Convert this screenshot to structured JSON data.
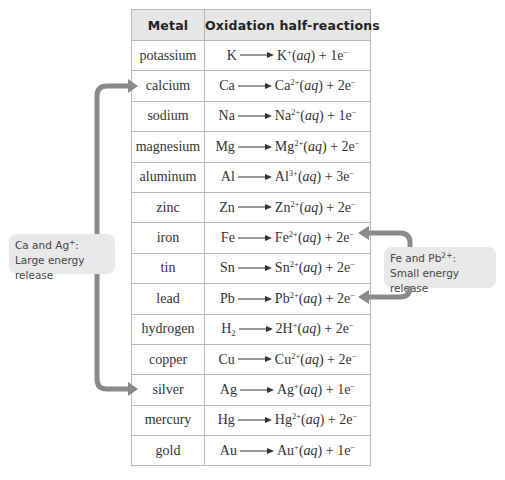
{
  "table": {
    "headers": [
      "Metal",
      "Oxidation half-reactions"
    ],
    "rows": [
      {
        "metal": "potassium",
        "reactant": "K",
        "reactant_sub": "",
        "coef": "",
        "ion": "K",
        "charge": "+",
        "state": "aq",
        "electrons": "1e",
        "e_charge": "−"
      },
      {
        "metal": "calcium",
        "reactant": "Ca",
        "reactant_sub": "",
        "coef": "",
        "ion": "Ca",
        "charge": "2+",
        "state": "aq",
        "electrons": "2e",
        "e_charge": "−"
      },
      {
        "metal": "sodium",
        "reactant": "Na",
        "reactant_sub": "",
        "coef": "",
        "ion": "Na",
        "charge": "2+",
        "state": "aq",
        "electrons": "1e",
        "e_charge": "−"
      },
      {
        "metal": "magnesium",
        "reactant": "Mg",
        "reactant_sub": "",
        "coef": "",
        "ion": "Mg",
        "charge": "2+",
        "state": "aq",
        "electrons": "2e",
        "e_charge": "−"
      },
      {
        "metal": "aluminum",
        "reactant": "Al",
        "reactant_sub": "",
        "coef": "",
        "ion": "Al",
        "charge": "3+",
        "state": "aq",
        "electrons": "3e",
        "e_charge": "−"
      },
      {
        "metal": "zinc",
        "reactant": "Zn",
        "reactant_sub": "",
        "coef": "",
        "ion": "Zn",
        "charge": "2+",
        "state": "aq",
        "electrons": "2e",
        "e_charge": "−"
      },
      {
        "metal": "iron",
        "reactant": "Fe",
        "reactant_sub": "",
        "coef": "",
        "ion": "Fe",
        "charge": "2+",
        "state": "aq",
        "electrons": "2e",
        "e_charge": "−"
      },
      {
        "metal": "tin",
        "reactant": "Sn",
        "reactant_sub": "",
        "coef": "",
        "ion": "Sn",
        "charge": "2+",
        "state": "aq",
        "electrons": "2e",
        "e_charge": "−"
      },
      {
        "metal": "lead",
        "reactant": "Pb",
        "reactant_sub": "",
        "coef": "",
        "ion": "Pb",
        "charge": "2+",
        "state": "aq",
        "electrons": "2e",
        "e_charge": "−"
      },
      {
        "metal": "hydrogen",
        "reactant": "H",
        "reactant_sub": "2",
        "coef": "2",
        "ion": "H",
        "charge": "+",
        "state": "aq",
        "electrons": "2e",
        "e_charge": "−"
      },
      {
        "metal": "copper",
        "reactant": "Cu",
        "reactant_sub": "",
        "coef": "",
        "ion": "Cu",
        "charge": "2+",
        "state": "aq",
        "electrons": "2e",
        "e_charge": "−"
      },
      {
        "metal": "silver",
        "reactant": "Ag",
        "reactant_sub": "",
        "coef": "",
        "ion": "Ag",
        "charge": "+",
        "state": "aq",
        "electrons": "1e",
        "e_charge": "−"
      },
      {
        "metal": "mercury",
        "reactant": "Hg",
        "reactant_sub": "",
        "coef": "",
        "ion": "Hg",
        "charge": "2+",
        "state": "aq",
        "electrons": "2e",
        "e_charge": "−"
      },
      {
        "metal": "gold",
        "reactant": "Au",
        "reactant_sub": "",
        "coef": "",
        "ion": "Au",
        "charge": "+",
        "state": "aq",
        "electrons": "1e",
        "e_charge": "−"
      }
    ]
  },
  "callouts": {
    "left": {
      "line1_prefix": "Ca and Ag",
      "line1_charge": "+",
      "line1_suffix": ":",
      "line2": "Large energy release"
    },
    "right": {
      "line1_prefix": "Fe and Pb",
      "line1_charge": "2+",
      "line1_suffix": ":",
      "line2": "Small energy release"
    }
  },
  "colors": {
    "arrow": "#8a8a8a",
    "callout_bg": "#e9e9e9",
    "header_bg": "#e6e6e6",
    "grid": "#b8b8b8"
  }
}
